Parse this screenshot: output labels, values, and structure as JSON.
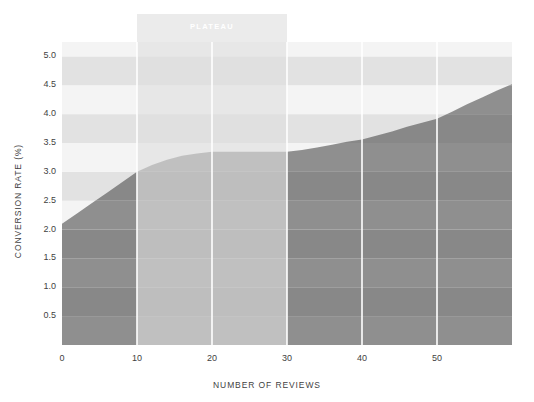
{
  "chart_data": {
    "type": "area",
    "title": "",
    "xlabel": "NUMBER OF REVIEWS",
    "ylabel": "CONVERSION RATE (%)",
    "xlim": [
      0,
      60
    ],
    "ylim": [
      0,
      5.25
    ],
    "xticks": [
      "0",
      "10",
      "20",
      "30",
      "40",
      "50"
    ],
    "xtick_values": [
      0,
      10,
      20,
      30,
      40,
      50
    ],
    "yticks": [
      "0.5",
      "1.0",
      "1.5",
      "2.0",
      "2.5",
      "3.0",
      "3.5",
      "4.0",
      "4.5",
      "5.0"
    ],
    "ytick_values": [
      0.5,
      1.0,
      1.5,
      2.0,
      2.5,
      3.0,
      3.5,
      4.0,
      4.5,
      5.0
    ],
    "grid": "vertical-white-gridlines-and-horizontal-banded-stripes",
    "legend": "none",
    "x": [
      0,
      2,
      4,
      6,
      8,
      10,
      12,
      14,
      16,
      18,
      20,
      22,
      24,
      26,
      28,
      30,
      32,
      34,
      36,
      38,
      40,
      42,
      44,
      46,
      48,
      50,
      52,
      54,
      56,
      58,
      60
    ],
    "values": [
      2.1,
      2.28,
      2.46,
      2.64,
      2.82,
      3.0,
      3.12,
      3.21,
      3.28,
      3.32,
      3.35,
      3.35,
      3.35,
      3.35,
      3.35,
      3.35,
      3.38,
      3.42,
      3.47,
      3.52,
      3.56,
      3.63,
      3.7,
      3.78,
      3.85,
      3.92,
      4.04,
      4.17,
      4.29,
      4.41,
      4.52
    ],
    "series": [
      {
        "name": "Conversion rate",
        "values": [
          2.1,
          2.28,
          2.46,
          2.64,
          2.82,
          3.0,
          3.12,
          3.21,
          3.28,
          3.32,
          3.35,
          3.35,
          3.35,
          3.35,
          3.35,
          3.35,
          3.38,
          3.42,
          3.47,
          3.52,
          3.56,
          3.63,
          3.7,
          3.78,
          3.85,
          3.92,
          4.04,
          4.17,
          4.29,
          4.41,
          4.52
        ]
      }
    ],
    "annotations": [
      {
        "text": "PLATEAU",
        "x_start": 10,
        "x_end": 30,
        "type": "vertical-span-band"
      }
    ],
    "colors": {
      "area_fill": "#8c8c8c",
      "band_stripe_light": "#f4f4f4",
      "band_stripe_dark": "#e2e2e2",
      "gridline": "#ffffff",
      "plateau_band": "#e0e0e0",
      "plateau_text": "#ffffff",
      "tick_text": "#3f3f3f",
      "background": "#ffffff"
    }
  }
}
